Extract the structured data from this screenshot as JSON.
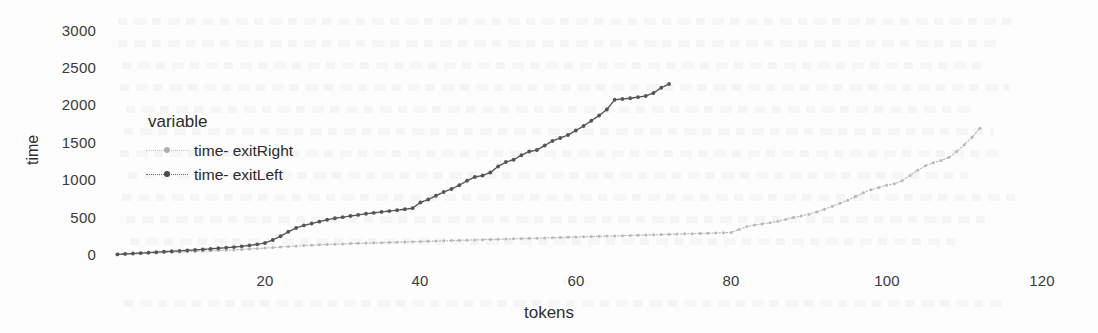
{
  "chart_data": {
    "type": "line",
    "title": "",
    "xlabel": "tokens",
    "ylabel": "time",
    "xlim": [
      0,
      125
    ],
    "ylim": [
      0,
      3100
    ],
    "xticks": [
      20,
      40,
      60,
      80,
      100,
      120
    ],
    "yticks": [
      0,
      500,
      1000,
      1500,
      2000,
      2500,
      3000
    ],
    "grid": false,
    "legend": {
      "title": "variable",
      "position": "inside-upper-left",
      "entries": [
        "time- exitRight",
        "time- exitLeft"
      ]
    },
    "series": [
      {
        "name": "time- exitRight",
        "color": "#b8b8b8",
        "marker": "dot",
        "linestyle": "dotted",
        "x": [
          1,
          2,
          3,
          4,
          5,
          6,
          7,
          8,
          9,
          10,
          11,
          12,
          13,
          14,
          15,
          16,
          17,
          18,
          19,
          20,
          21,
          22,
          23,
          24,
          25,
          26,
          27,
          28,
          29,
          30,
          31,
          32,
          33,
          34,
          35,
          36,
          37,
          38,
          39,
          40,
          41,
          42,
          43,
          44,
          45,
          46,
          47,
          48,
          49,
          50,
          51,
          52,
          53,
          54,
          55,
          56,
          57,
          58,
          59,
          60,
          61,
          62,
          63,
          64,
          65,
          66,
          67,
          68,
          69,
          70,
          71,
          72,
          73,
          74,
          75,
          76,
          77,
          78,
          79,
          80,
          81,
          82,
          83,
          84,
          85,
          86,
          87,
          88,
          89,
          90,
          91,
          92,
          93,
          94,
          95,
          96,
          97,
          98,
          99,
          100,
          101,
          102,
          103,
          104,
          105,
          106,
          107,
          108,
          109,
          110,
          111,
          112
        ],
        "y": [
          8,
          12,
          16,
          20,
          24,
          28,
          32,
          36,
          40,
          44,
          48,
          52,
          56,
          60,
          64,
          68,
          74,
          80,
          86,
          92,
          100,
          108,
          114,
          120,
          126,
          131,
          136,
          140,
          144,
          148,
          152,
          156,
          159,
          162,
          165,
          168,
          171,
          174,
          177,
          180,
          183,
          186,
          189,
          192,
          195,
          198,
          201,
          204,
          207,
          210,
          213,
          216,
          219,
          222,
          225,
          228,
          231,
          234,
          237,
          240,
          243,
          246,
          249,
          252,
          255,
          258,
          261,
          264,
          267,
          270,
          273,
          276,
          279,
          282,
          285,
          288,
          291,
          294,
          297,
          300,
          340,
          380,
          400,
          415,
          430,
          450,
          475,
          500,
          520,
          545,
          575,
          610,
          650,
          690,
          730,
          780,
          830,
          870,
          900,
          930,
          950,
          990,
          1060,
          1130,
          1190,
          1230,
          1260,
          1300,
          1380,
          1470,
          1570,
          1690
        ]
      },
      {
        "name": "time- exitLeft",
        "color": "#555555",
        "marker": "dot",
        "linestyle": "solid-dotted",
        "x": [
          1,
          2,
          3,
          4,
          5,
          6,
          7,
          8,
          9,
          10,
          11,
          12,
          13,
          14,
          15,
          16,
          17,
          18,
          19,
          20,
          21,
          22,
          23,
          24,
          25,
          26,
          27,
          28,
          29,
          30,
          31,
          32,
          33,
          34,
          35,
          36,
          37,
          38,
          39,
          40,
          41,
          42,
          43,
          44,
          45,
          46,
          47,
          48,
          49,
          50,
          51,
          52,
          53,
          54,
          55,
          56,
          57,
          58,
          59,
          60,
          61,
          62,
          63,
          64,
          65,
          66,
          67,
          68,
          69,
          70,
          71,
          72
        ],
        "y": [
          8,
          14,
          20,
          26,
          32,
          38,
          44,
          50,
          56,
          62,
          68,
          74,
          82,
          90,
          98,
          106,
          116,
          128,
          142,
          160,
          200,
          250,
          310,
          360,
          395,
          420,
          445,
          470,
          490,
          505,
          520,
          535,
          550,
          562,
          574,
          586,
          598,
          610,
          625,
          700,
          740,
          790,
          840,
          880,
          930,
          990,
          1040,
          1060,
          1100,
          1180,
          1240,
          1270,
          1330,
          1380,
          1400,
          1460,
          1520,
          1560,
          1600,
          1660,
          1720,
          1790,
          1860,
          1940,
          2070,
          2080,
          2090,
          2105,
          2120,
          2160,
          2230,
          2280
        ]
      }
    ]
  },
  "axes": {
    "y_tick_labels": [
      "3000",
      "2500",
      "2000",
      "1500",
      "1000",
      "500",
      "0"
    ],
    "x_tick_labels": [
      "20",
      "40",
      "60",
      "80",
      "100",
      "120"
    ],
    "y_title": "time",
    "x_title": "tokens"
  },
  "legend": {
    "title": "variable",
    "items": [
      {
        "label": "time- exitRight",
        "color": "#b8b8b8"
      },
      {
        "label": "time- exitLeft",
        "color": "#555555"
      }
    ]
  }
}
